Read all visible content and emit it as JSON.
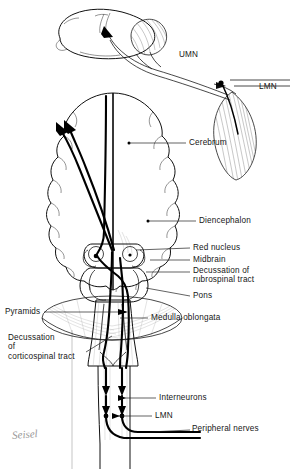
{
  "figure": {
    "background_color": "#ffffff",
    "ink_color": "#111111",
    "signature": "Seisel"
  },
  "labels": {
    "umn": "UMN",
    "lmn_muscle": "LMN",
    "cerebrum": "Cerebrum",
    "diencephalon": "Diencephalon",
    "red_nucleus": "Red nucleus",
    "midbrain": "Midbrain",
    "decussation_rubrospinal": "Decussation of\nrubrospinal tract",
    "pons": "Pons",
    "medulla_oblongata": "Medulla oblongata",
    "pyramids": "Pyramids",
    "decussation_corticospinal": "Decussation\nof\ncorticospinal tract",
    "interneurons": "Interneurons",
    "lmn_cord": "LMN",
    "peripheral_nerves": "Peripheral nerves"
  },
  "structures": {
    "lateral_brain": "lateral-brain-view",
    "cerebellum_lateral": "cerebellum-hatched",
    "skeletal_muscle": "striated-muscle",
    "coronal_brain": "coronal-brain-view",
    "brainstem": "brainstem",
    "spinal_cord": "spinal-cord"
  }
}
